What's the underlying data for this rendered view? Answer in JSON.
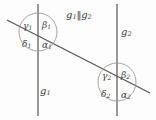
{
  "figure": {
    "relation": {
      "line_a": "g",
      "line_a_sub": "1",
      "parallel_symbol": "‖",
      "line_b": "g",
      "line_b_sub": "2"
    },
    "lines": [
      {
        "name": "g",
        "sub": "1",
        "kind": "vertical-parallel",
        "x": 38
      },
      {
        "name": "g",
        "sub": "2",
        "kind": "vertical-parallel",
        "x": 117
      },
      {
        "name": "",
        "sub": "",
        "kind": "transversal",
        "x1": 7,
        "y1": 20,
        "x2": 150,
        "y2": 93
      }
    ],
    "intersections": [
      {
        "id": "intersection-1",
        "cx": 38,
        "cy": 32,
        "r": 19,
        "angles": [
          {
            "id": "gamma1",
            "symbol": "γ",
            "sub": "1",
            "position": "top-left"
          },
          {
            "id": "beta1",
            "symbol": "β",
            "sub": "1",
            "position": "top-right"
          },
          {
            "id": "delta1",
            "symbol": "δ",
            "sub": "1",
            "position": "bottom-left"
          },
          {
            "id": "alpha1",
            "symbol": "α",
            "sub": "1",
            "position": "bottom-right"
          }
        ]
      },
      {
        "id": "intersection-2",
        "cx": 117,
        "cy": 82,
        "r": 19,
        "angles": [
          {
            "id": "gamma2",
            "symbol": "γ",
            "sub": "2",
            "position": "top-left"
          },
          {
            "id": "beta2",
            "symbol": "β",
            "sub": "2",
            "position": "top-right"
          },
          {
            "id": "delta2",
            "symbol": "δ",
            "sub": "2",
            "position": "bottom-left"
          },
          {
            "id": "alpha2",
            "symbol": "α",
            "sub": "2",
            "position": "bottom-right"
          }
        ]
      }
    ],
    "colors": {
      "background": "#fdfdfd",
      "line_stroke": "#555555",
      "circle_stroke": "#9a9a9a",
      "text": "#3c3c3c"
    }
  }
}
